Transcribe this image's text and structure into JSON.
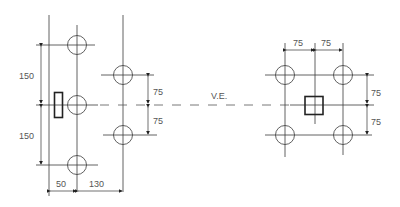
{
  "diagram": {
    "center_label": "V.E.",
    "left_group": {
      "vertical_dims": [
        "150",
        "150"
      ],
      "horizontal_dims": [
        "50",
        "130"
      ]
    },
    "middle_group": {
      "vertical_dims": [
        "75",
        "75"
      ]
    },
    "right_group": {
      "top_dims": [
        "75",
        "75"
      ],
      "vertical_dims": [
        "75",
        "75"
      ]
    }
  }
}
